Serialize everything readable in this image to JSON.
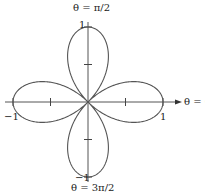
{
  "chart_data": {
    "type": "line",
    "subtype": "polar",
    "equation": "r = cos(2θ)",
    "title": "",
    "axis_labels": {
      "top": "θ = π/2",
      "right": "θ = 0",
      "bottom": "θ = 3π/2"
    },
    "tick_labels": {
      "x_positive": "1",
      "x_negative": "−1",
      "y_positive": "1",
      "y_negative": "−1"
    },
    "ticks": [
      -1,
      -0.5,
      0.5,
      1
    ],
    "xlim": [
      -1,
      1
    ],
    "ylim": [
      -1,
      1
    ],
    "petals": 4,
    "grid": false,
    "legend": null,
    "colors": {
      "curve": "#555555",
      "axis": "#555555"
    }
  },
  "labels": {
    "top_axis": "θ = π/2",
    "right_axis": "θ = 0",
    "bottom_axis": "θ = 3π/2",
    "tick_right": "1",
    "tick_left": "−1",
    "tick_top": "1",
    "tick_bottom": "−1"
  }
}
